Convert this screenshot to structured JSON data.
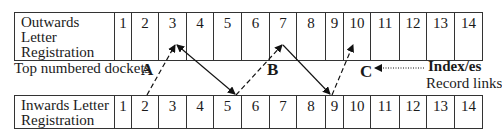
{
  "top_register": {
    "label_line1": "Outwards Letter",
    "label_line2": "Registration",
    "numbers": [
      "1",
      "2",
      "3",
      "4",
      "5",
      "6",
      "7",
      "8",
      "9",
      "10",
      "11",
      "12",
      "13",
      "14"
    ]
  },
  "bottom_register": {
    "label_line1": "Inwards Letter",
    "label_line2": "Registration",
    "numbers": [
      "1",
      "2",
      "3",
      "4",
      "5",
      "6",
      "7",
      "8",
      "9",
      "10",
      "11",
      "12",
      "13",
      "14"
    ]
  },
  "middle_label": "Top numbered dockets",
  "link_labels": {
    "a": "A",
    "b": "B",
    "c": "C"
  },
  "index_note": {
    "title": "Index/es",
    "subtitle": "Record links"
  },
  "column_widths": [
    17,
    27,
    28,
    27,
    28,
    28,
    27,
    29,
    18,
    27,
    29,
    27,
    28,
    28
  ]
}
